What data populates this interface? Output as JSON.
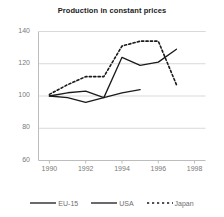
{
  "chart_data": {
    "type": "line",
    "title": "Production in constant prices",
    "xlabel": "",
    "ylabel": "",
    "xlim": [
      1989.4,
      1998.6
    ],
    "ylim": [
      60,
      140
    ],
    "xticks": [
      1990,
      1992,
      1994,
      1996,
      1998
    ],
    "yticks": [
      60,
      80,
      100,
      120,
      140
    ],
    "grid": true,
    "legend_position": "bottom",
    "series": [
      {
        "name": "EU-15",
        "style": "solid",
        "color": "#1a1a1a",
        "x": [
          1990,
          1991,
          1992,
          1993,
          1994,
          1995
        ],
        "values": [
          100,
          99,
          96,
          99,
          102,
          104
        ]
      },
      {
        "name": "USA",
        "style": "solid",
        "color": "#1a1a1a",
        "x": [
          1990,
          1991,
          1992,
          1993,
          1994,
          1995,
          1996,
          1997
        ],
        "values": [
          100,
          102,
          103,
          99,
          124,
          119,
          121,
          129
        ]
      },
      {
        "name": "Japan",
        "style": "dashed",
        "color": "#1a1a1a",
        "x": [
          1990,
          1991,
          1992,
          1993,
          1994,
          1995,
          1996,
          1997
        ],
        "values": [
          101,
          107,
          112,
          112,
          131,
          134,
          134,
          107
        ]
      }
    ]
  },
  "legend": {
    "items": [
      {
        "label": "EU-15",
        "style": "solid"
      },
      {
        "label": "USA",
        "style": "solid"
      },
      {
        "label": "Japan",
        "style": "dashed"
      }
    ]
  },
  "colors": {
    "line": "#1a1a1a",
    "grid": "#d9d9d9",
    "axis": "#bdbdbd",
    "tick_text": "#7a7a7a",
    "title_text": "#1a1a1a",
    "background": "#ffffff"
  }
}
